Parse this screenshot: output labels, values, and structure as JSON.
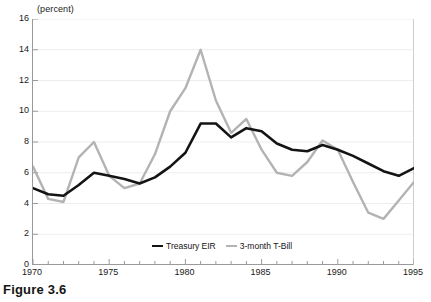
{
  "caption": "Figure 3.6",
  "axis_unit_label": "(percent)",
  "legend": {
    "position": "inside-bottom-center",
    "entries": [
      {
        "label": "Treasury  EIR",
        "color": "#141414"
      },
      {
        "label": "3-month  T-Bill",
        "color": "#b3b3b3"
      }
    ]
  },
  "chart_data": {
    "type": "line",
    "title": "",
    "subtitle": "",
    "xlabel": "",
    "ylabel": "(percent)",
    "xlim": [
      1970,
      1995
    ],
    "ylim": [
      0,
      16
    ],
    "ytick_labels": [
      "0",
      "2",
      "4",
      "6",
      "8",
      "10",
      "12",
      "14",
      "16"
    ],
    "yticks": [
      0,
      2,
      4,
      6,
      8,
      10,
      12,
      14,
      16
    ],
    "xtick_labels": [
      "1970",
      "1975",
      "1980",
      "1985",
      "1990",
      "1995"
    ],
    "xticks": [
      1970,
      1975,
      1980,
      1985,
      1990,
      1995
    ],
    "x_minor_tick_interval": 1,
    "grid": "horizontal-light",
    "legend_position": "inside-bottom-center",
    "x": [
      1970,
      1971,
      1972,
      1973,
      1974,
      1975,
      1976,
      1977,
      1978,
      1979,
      1980,
      1981,
      1982,
      1983,
      1984,
      1985,
      1986,
      1987,
      1988,
      1989,
      1990,
      1991,
      1992,
      1993,
      1994,
      1995
    ],
    "series": [
      {
        "name": "Treasury  EIR",
        "color": "#141414",
        "width": 2.6,
        "values": [
          5.0,
          4.6,
          4.5,
          5.2,
          6.0,
          5.8,
          5.6,
          5.3,
          5.7,
          6.4,
          7.3,
          9.2,
          9.2,
          8.3,
          8.9,
          8.7,
          7.9,
          7.5,
          7.4,
          7.8,
          7.5,
          7.1,
          6.6,
          6.1,
          5.8,
          6.3
        ]
      },
      {
        "name": "3-month  T-Bill",
        "color": "#b3b3b3",
        "width": 2.4,
        "values": [
          6.4,
          4.3,
          4.1,
          7.0,
          8.0,
          5.8,
          5.0,
          5.3,
          7.2,
          10.0,
          11.5,
          14.0,
          10.7,
          8.6,
          9.5,
          7.5,
          6.0,
          5.8,
          6.7,
          8.1,
          7.5,
          5.4,
          3.4,
          3.0,
          4.2,
          5.4
        ]
      }
    ]
  }
}
